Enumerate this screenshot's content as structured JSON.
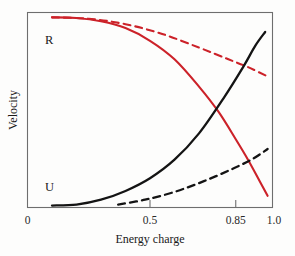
{
  "chart_data": {
    "type": "line",
    "title": "",
    "xlabel": "Energy charge",
    "ylabel": "Velocity",
    "xlim": [
      0,
      1.0
    ],
    "ylim": [
      0,
      1.0
    ],
    "grid": false,
    "legend_position": "inline-curve-labels",
    "xticks": [
      {
        "value": 0,
        "label": "0"
      },
      {
        "value": 0.5,
        "label": "0.5"
      },
      {
        "value": 0.85,
        "label": "0.85"
      },
      {
        "value": 1.0,
        "label": "1.0"
      }
    ],
    "yticks": [],
    "annotations": [
      {
        "text": "R",
        "x": 0.1,
        "y": 0.92,
        "note": "label for regulated ATP-regenerating curve"
      },
      {
        "text": "U",
        "x": 0.1,
        "y": 0.07,
        "note": "label for ATP-utilizing curve"
      }
    ],
    "series": [
      {
        "name": "R",
        "style": "solid",
        "color": "#cc2229",
        "x": [
          0.1,
          0.2,
          0.3,
          0.4,
          0.5,
          0.6,
          0.7,
          0.78,
          0.85,
          0.9,
          0.95,
          0.98
        ],
        "y": [
          0.975,
          0.972,
          0.955,
          0.92,
          0.855,
          0.76,
          0.62,
          0.49,
          0.35,
          0.245,
          0.13,
          0.06
        ]
      },
      {
        "name": "R-unregulated",
        "style": "dashed",
        "color": "#cc2229",
        "x": [
          0.1,
          0.25,
          0.4,
          0.55,
          0.7,
          0.82,
          0.9,
          0.98
        ],
        "y": [
          0.975,
          0.968,
          0.94,
          0.89,
          0.82,
          0.76,
          0.72,
          0.672
        ]
      },
      {
        "name": "U",
        "style": "solid",
        "color": "#141414",
        "x": [
          0.1,
          0.2,
          0.3,
          0.4,
          0.5,
          0.6,
          0.7,
          0.8,
          0.88,
          0.93,
          0.97
        ],
        "y": [
          0.01,
          0.015,
          0.04,
          0.085,
          0.15,
          0.245,
          0.38,
          0.56,
          0.72,
          0.83,
          0.9
        ]
      },
      {
        "name": "U-unregulated",
        "style": "dashed",
        "color": "#141414",
        "x": [
          0.37,
          0.48,
          0.6,
          0.72,
          0.84,
          0.92,
          0.98
        ],
        "y": [
          0.015,
          0.04,
          0.08,
          0.135,
          0.2,
          0.25,
          0.3
        ]
      }
    ]
  },
  "labels": {
    "xaxis_title": "Energy charge",
    "yaxis_title": "Velocity",
    "curve_r": "R",
    "curve_u": "U",
    "tick_0": "0",
    "tick_05": "0.5",
    "tick_085": "0.85",
    "tick_10": "1.0"
  },
  "colors": {
    "red_curve": "#cc2229",
    "black_curve": "#141414",
    "axis": "#6e6e6e",
    "background": "#fdfdfc"
  }
}
